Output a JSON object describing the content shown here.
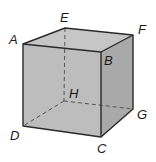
{
  "figure": {
    "type": "cube",
    "colors": {
      "front_face": "#bdbdbd",
      "top_face": "#c6c6c6",
      "right_face": "#a9a9a9",
      "edge": "#2a2a2a",
      "hidden_edge": "#555555",
      "background": "#ffffff"
    },
    "vertices": {
      "A": {
        "label": "A",
        "x": 23,
        "y": 44
      },
      "B": {
        "label": "B",
        "x": 101,
        "y": 52
      },
      "C": {
        "label": "C",
        "x": 101,
        "y": 137
      },
      "D": {
        "label": "D",
        "x": 23,
        "y": 126
      },
      "E": {
        "label": "E",
        "x": 65,
        "y": 28
      },
      "F": {
        "label": "F",
        "x": 133,
        "y": 35
      },
      "G": {
        "label": "G",
        "x": 133,
        "y": 109
      },
      "H": {
        "label": "H",
        "x": 64,
        "y": 101
      }
    },
    "visible_edges": [
      "AB",
      "BC",
      "CD",
      "DA",
      "AE",
      "EF",
      "FB",
      "FG",
      "GC"
    ],
    "hidden_edges": [
      "EH",
      "HD",
      "HG"
    ]
  }
}
